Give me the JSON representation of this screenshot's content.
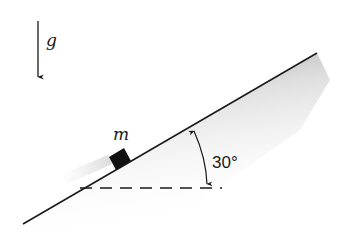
{
  "diagram": {
    "gravity": {
      "label": "g",
      "direction": "down",
      "icon": "down-arrow-icon"
    },
    "block": {
      "label": "m",
      "color": "#111111"
    },
    "incline": {
      "angle_label": "30°",
      "angle_degrees": 30,
      "surface_color": "#1a1a1a",
      "shade_color": "#9a9a9a"
    },
    "reference_line": {
      "style": "dashed",
      "orientation": "horizontal"
    }
  }
}
